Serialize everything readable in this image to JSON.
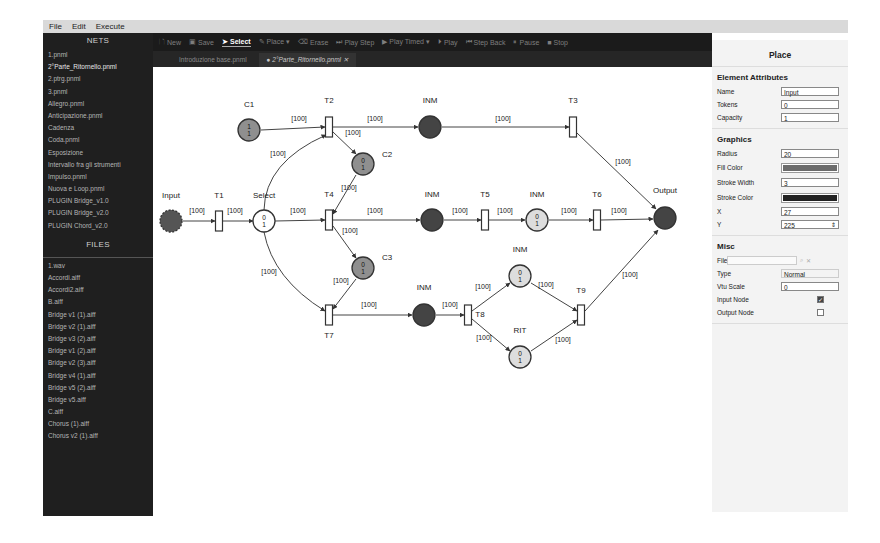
{
  "menu": [
    "File",
    "Edit",
    "Execute"
  ],
  "sidebar": {
    "nets_title": "NETS",
    "nets": [
      "1.pnml",
      "2°Parte_Ritornello.pnml",
      "2.ptrg.pnml",
      "3.pnml",
      "Allegro.pnml",
      "Anticipazione.pnml",
      "Cadenza",
      "Coda.pnml",
      "Esposizione",
      "Intervallo fra gli strumenti",
      "Impulso.pnml",
      "Nuova e Loop.pnml",
      "PLUGIN Bridge_v1.0",
      "PLUGIN Bridge_v2.0",
      "PLUGIN Chord_v2.0"
    ],
    "active_net_index": 1,
    "files_title": "FILES",
    "files": [
      "1.wav",
      "Accordi.aiff",
      "Accordi2.aiff",
      "B.aiff",
      "Bridge v1 (1).aiff",
      "Bridge v2 (1).aiff",
      "Bridge v3 (2).aiff",
      "Bridge v1 (2).aiff",
      "Bridge v2 (3).aiff",
      "Bridge v4 (1).aiff",
      "Bridge v5 (2).aiff",
      "Bridge v5.aiff",
      "C.aiff",
      "Chorus (1).aiff",
      "Chorus v2 (1).aiff"
    ]
  },
  "toolbar": {
    "items": [
      {
        "icon": "new-file-icon",
        "glyph": "🗋",
        "label": "New",
        "active": false
      },
      {
        "icon": "save-icon",
        "glyph": "▣",
        "label": "Save",
        "active": false
      },
      {
        "icon": "cursor-icon",
        "glyph": "➤",
        "label": "Select",
        "active": true
      },
      {
        "icon": "pencil-icon",
        "glyph": "✎",
        "label": "Place ▾",
        "active": false
      },
      {
        "icon": "eraser-icon",
        "glyph": "⌫",
        "label": "Erase",
        "active": false
      },
      {
        "icon": "step-forward-icon",
        "glyph": "⏭",
        "label": "Play Step",
        "active": false
      },
      {
        "icon": "play-icon",
        "glyph": "▶",
        "label": "Play Timed ▾",
        "active": false
      },
      {
        "icon": "play-circle-icon",
        "glyph": "⏵",
        "label": "Play",
        "active": false
      },
      {
        "icon": "step-back-icon",
        "glyph": "⏮",
        "label": "Step Back",
        "active": false
      },
      {
        "icon": "pause-icon",
        "glyph": "⏸",
        "label": "Pause",
        "active": false
      },
      {
        "icon": "stop-icon",
        "glyph": "■",
        "label": "Stop",
        "active": false
      }
    ]
  },
  "tabs": [
    {
      "label": "Introduzione base.pnml",
      "active": false
    },
    {
      "label": "● 2°Parte_Ritornello.pnml  ✕",
      "active": true
    }
  ],
  "net": {
    "places": [
      {
        "id": "Input",
        "label": "Input",
        "x": 18,
        "y": 154,
        "fill": "#555555",
        "tokens": "",
        "selected": true,
        "lx": 18,
        "ly": 131
      },
      {
        "id": "C1",
        "label": "C1",
        "x": 96,
        "y": 63,
        "fill": "#8f8f8f",
        "tokens": "1\n1",
        "lx": 96,
        "ly": 40
      },
      {
        "id": "Select",
        "label": "Select",
        "x": 111,
        "y": 154,
        "fill": "#ffffff",
        "tokens": "0\n1",
        "lx": 111,
        "ly": 131
      },
      {
        "id": "C2",
        "label": "C2",
        "x": 210,
        "y": 97,
        "fill": "#8f8f8f",
        "tokens": "0\n1",
        "lx": 234,
        "ly": 90
      },
      {
        "id": "C3",
        "label": "C3",
        "x": 210,
        "y": 201,
        "fill": "#8f8f8f",
        "tokens": "0\n1",
        "lx": 234,
        "ly": 193
      },
      {
        "id": "INM1",
        "label": "INM",
        "x": 277,
        "y": 60,
        "fill": "#444444",
        "tokens": "",
        "lx": 277,
        "ly": 36
      },
      {
        "id": "INM2",
        "label": "INM",
        "x": 279,
        "y": 153,
        "fill": "#444444",
        "tokens": "",
        "lx": 279,
        "ly": 130
      },
      {
        "id": "INM3",
        "label": "INM",
        "x": 384,
        "y": 153,
        "fill": "#dddddd",
        "tokens": "0\n1",
        "lx": 384,
        "ly": 130
      },
      {
        "id": "Output",
        "label": "Output",
        "x": 512,
        "y": 151,
        "fill": "#444444",
        "tokens": "",
        "lx": 512,
        "ly": 126
      },
      {
        "id": "INM4",
        "label": "INM",
        "x": 271,
        "y": 248,
        "fill": "#444444",
        "tokens": "",
        "lx": 271,
        "ly": 223
      },
      {
        "id": "INM5",
        "label": "INM",
        "x": 367,
        "y": 209,
        "fill": "#dddddd",
        "tokens": "0\n1",
        "lx": 367,
        "ly": 185
      },
      {
        "id": "RIT",
        "label": "RIT",
        "x": 367,
        "y": 290,
        "fill": "#dddddd",
        "tokens": "0\n1",
        "lx": 367,
        "ly": 266
      }
    ],
    "transitions": [
      {
        "id": "T1",
        "label": "T1",
        "x": 66,
        "y": 154,
        "lx": 66,
        "ly": 131
      },
      {
        "id": "T2",
        "label": "T2",
        "x": 176,
        "y": 60,
        "lx": 176,
        "ly": 36
      },
      {
        "id": "T3",
        "label": "T3",
        "x": 420,
        "y": 60,
        "lx": 420,
        "ly": 36
      },
      {
        "id": "T4",
        "label": "T4",
        "x": 176,
        "y": 153,
        "lx": 176,
        "ly": 130
      },
      {
        "id": "T5",
        "label": "T5",
        "x": 332,
        "y": 153,
        "lx": 332,
        "ly": 130
      },
      {
        "id": "T6",
        "label": "T6",
        "x": 444,
        "y": 153,
        "lx": 444,
        "ly": 130
      },
      {
        "id": "T7",
        "label": "T7",
        "x": 176,
        "y": 248,
        "lx": 176,
        "ly": 271
      },
      {
        "id": "T8",
        "label": "T8",
        "x": 315,
        "y": 248,
        "lx": 327,
        "ly": 250
      },
      {
        "id": "T9",
        "label": "T9",
        "x": 428,
        "y": 248,
        "lx": 428,
        "ly": 226
      }
    ],
    "arcs": [
      {
        "from": [
          30,
          154
        ],
        "to": [
          62,
          154
        ],
        "w": "[100]",
        "wx": 44,
        "wy": 146
      },
      {
        "from": [
          70,
          154
        ],
        "to": [
          100,
          154
        ],
        "w": "[100]",
        "wx": 82,
        "wy": 146
      },
      {
        "from": [
          108,
          63
        ],
        "to": [
          172,
          60
        ],
        "w": "[100]",
        "wx": 146,
        "wy": 54
      },
      {
        "from": [
          180,
          60
        ],
        "to": [
          265,
          60
        ],
        "w": "[100]",
        "wx": 222,
        "wy": 54
      },
      {
        "from": [
          180,
          65
        ],
        "to": [
          203,
          87
        ],
        "w": "[100]",
        "wx": 200,
        "wy": 68
      },
      {
        "from": [
          111,
          143
        ],
        "to": [
          173,
          68
        ],
        "curve": [
          112,
          95
        ],
        "w": "[100]",
        "wx": 125,
        "wy": 89
      },
      {
        "from": [
          289,
          60
        ],
        "to": [
          416,
          60
        ],
        "w": "[100]",
        "wx": 350,
        "wy": 54
      },
      {
        "from": [
          424,
          66
        ],
        "to": [
          503,
          142
        ],
        "w": "[100]",
        "wx": 470,
        "wy": 97
      },
      {
        "from": [
          122,
          154
        ],
        "to": [
          172,
          153
        ],
        "w": "[100]",
        "wx": 145,
        "wy": 146
      },
      {
        "from": [
          203,
          108
        ],
        "to": [
          180,
          147
        ],
        "w": "[100]",
        "wx": 196,
        "wy": 123
      },
      {
        "from": [
          180,
          153
        ],
        "to": [
          267,
          153
        ],
        "w": "[100]",
        "wx": 222,
        "wy": 146
      },
      {
        "from": [
          180,
          159
        ],
        "to": [
          203,
          191
        ],
        "w": "[100]",
        "wx": 197,
        "wy": 166
      },
      {
        "from": [
          291,
          153
        ],
        "to": [
          328,
          153
        ],
        "w": "[100]",
        "wx": 307,
        "wy": 146
      },
      {
        "from": [
          336,
          153
        ],
        "to": [
          372,
          153
        ],
        "w": "[100]",
        "wx": 352,
        "wy": 146
      },
      {
        "from": [
          396,
          153
        ],
        "to": [
          440,
          153
        ],
        "w": "[100]",
        "wx": 416,
        "wy": 146
      },
      {
        "from": [
          448,
          153
        ],
        "to": [
          500,
          152
        ],
        "w": "[100]",
        "wx": 466,
        "wy": 146
      },
      {
        "from": [
          111,
          165
        ],
        "to": [
          172,
          244
        ],
        "curve": [
          120,
          212
        ],
        "w": "[100]",
        "wx": 116,
        "wy": 207
      },
      {
        "from": [
          203,
          212
        ],
        "to": [
          180,
          242
        ],
        "w": "[100]",
        "wx": 188,
        "wy": 216
      },
      {
        "from": [
          180,
          248
        ],
        "to": [
          259,
          248
        ],
        "w": "[100]",
        "wx": 216,
        "wy": 240
      },
      {
        "from": [
          283,
          248
        ],
        "to": [
          311,
          248
        ],
        "w": "[100]",
        "wx": 297,
        "wy": 240
      },
      {
        "from": [
          319,
          244
        ],
        "to": [
          357,
          216
        ],
        "w": "[100]",
        "wx": 330,
        "wy": 222
      },
      {
        "from": [
          319,
          252
        ],
        "to": [
          357,
          284
        ],
        "w": "[100]",
        "wx": 331,
        "wy": 273
      },
      {
        "from": [
          378,
          216
        ],
        "to": [
          424,
          244
        ],
        "w": "[100]",
        "wx": 393,
        "wy": 220
      },
      {
        "from": [
          378,
          284
        ],
        "to": [
          424,
          253
        ],
        "w": "[100]",
        "wx": 410,
        "wy": 275
      },
      {
        "from": [
          432,
          244
        ],
        "to": [
          505,
          163
        ],
        "w": "[100]",
        "wx": 477,
        "wy": 210
      }
    ]
  },
  "panel": {
    "title": "Place",
    "element_attributes_title": "Element Attributes",
    "name_label": "Name",
    "name_value": "Input",
    "tokens_label": "Tokens",
    "tokens_value": "0",
    "capacity_label": "Capacity",
    "capacity_value": "1",
    "graphics_title": "Graphics",
    "radius_label": "Radius",
    "radius_value": "20",
    "fill_color_label": "Fill Color",
    "fill_color": "#6b6b6b",
    "stroke_width_label": "Stroke Width",
    "stroke_width_value": "3",
    "stroke_color_label": "Stroke Color",
    "stroke_color": "#222222",
    "x_label": "X",
    "x_value": "27",
    "y_label": "Y",
    "y_value": "225",
    "misc_title": "Misc",
    "file_label": "File",
    "file_value": "",
    "type_label": "Type",
    "type_value": "Normal",
    "vtu_scale_label": "Vtu Scale",
    "vtu_scale_value": "0",
    "input_node_label": "Input Node",
    "input_node_checked": true,
    "output_node_label": "Output Node",
    "output_node_checked": false
  }
}
